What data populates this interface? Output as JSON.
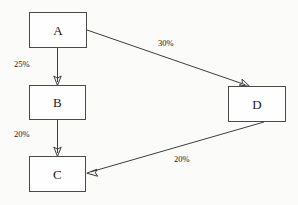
{
  "diagram": {
    "background_color": "#fbfbfa",
    "node_fill_color": "#fefefe",
    "node_border_color": "#4a4a4a",
    "edge_color": "#3d3d3d",
    "text_color": "#1a1a1a",
    "nodes": [
      {
        "id": "A",
        "label": "A",
        "x": 29,
        "y": 12,
        "width": 58,
        "height": 36
      },
      {
        "id": "B",
        "label": "B",
        "x": 29,
        "y": 85,
        "width": 57,
        "height": 35
      },
      {
        "id": "C",
        "label": "C",
        "x": 29,
        "y": 156,
        "width": 57,
        "height": 36
      },
      {
        "id": "D",
        "label": "D",
        "x": 228,
        "y": 86,
        "width": 58,
        "height": 36
      }
    ],
    "edges": [
      {
        "id": "a-to-b",
        "from": "A",
        "to": "B",
        "label": "25%",
        "label_x": 14,
        "label_y": 60,
        "x1": 57.5,
        "y1": 48,
        "x2": 57.5,
        "y2": 85
      },
      {
        "id": "b-to-c",
        "from": "B",
        "to": "C",
        "label": "20%",
        "label_x": 14,
        "label_y": 130,
        "x1": 57.5,
        "y1": 120,
        "x2": 57.5,
        "y2": 156
      },
      {
        "id": "a-to-d",
        "from": "A",
        "to": "D",
        "label": "30%",
        "label_x": 158,
        "label_y": 39,
        "x1": 87,
        "y1": 30,
        "x2": 249,
        "y2": 86
      },
      {
        "id": "d-to-c",
        "from": "D",
        "to": "C",
        "label": "20%",
        "label_x": 174,
        "label_y": 155,
        "x1": 264,
        "y1": 122,
        "x2": 87,
        "y2": 173
      }
    ]
  }
}
